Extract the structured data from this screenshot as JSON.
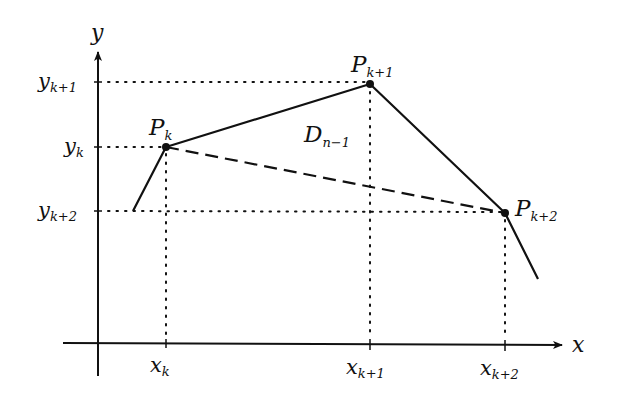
{
  "diagram": {
    "axes": {
      "x_label": "x",
      "y_label": "y"
    },
    "points": [
      {
        "name": "P",
        "sub": "k",
        "x": 166,
        "y": 147
      },
      {
        "name": "P",
        "sub": "k+1",
        "x": 370,
        "y": 84
      },
      {
        "name": "P",
        "sub": "k+2",
        "x": 505,
        "y": 213
      }
    ],
    "x_ticks": [
      {
        "base": "x",
        "sub": "k"
      },
      {
        "base": "x",
        "sub": "k+1"
      },
      {
        "base": "x",
        "sub": "k+2"
      }
    ],
    "y_ticks": [
      {
        "base": "y",
        "sub": "k+1"
      },
      {
        "base": "y",
        "sub": "k"
      },
      {
        "base": "y",
        "sub": "k+2"
      }
    ],
    "segment_label": {
      "base": "D",
      "sub": "n−1"
    },
    "polyline": {
      "start": [
        133,
        211
      ],
      "end": [
        538,
        279
      ]
    },
    "dashed_chord": "P_k to P_{k+2}",
    "colors": {
      "ink": "#111111",
      "background": "#ffffff"
    }
  }
}
